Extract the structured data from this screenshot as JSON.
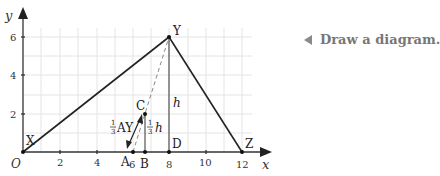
{
  "axes": {
    "x_label": "x",
    "y_label": "y",
    "origin_label": "O",
    "x_ticks": [
      "2",
      "4",
      "6",
      "8",
      "10",
      "12"
    ],
    "y_ticks": [
      "2",
      "4",
      "6"
    ]
  },
  "points": {
    "X": {
      "label": "X",
      "x": 0,
      "y": 0
    },
    "Y": {
      "label": "Y",
      "x": 8,
      "y": 6
    },
    "Z": {
      "label": "Z",
      "x": 12,
      "y": 0
    },
    "A": {
      "label": "A",
      "x": 6,
      "y": 0
    },
    "B": {
      "label": "B",
      "x": 6.67,
      "y": 0
    },
    "C": {
      "label": "C",
      "x": 6.67,
      "y": 2
    },
    "D": {
      "label": "D",
      "x": 8,
      "y": 0
    }
  },
  "annotations": {
    "height_label": "h",
    "third_ay_frac": "1/3",
    "third_ay_text": "AY",
    "third_h_frac": "1/3",
    "third_h_text": "h"
  },
  "caption": {
    "text": "Draw a diagram."
  },
  "colors": {
    "line": "#222222",
    "grid": "#e2e2e2",
    "dashed": "#888888",
    "caption": "#777777"
  }
}
